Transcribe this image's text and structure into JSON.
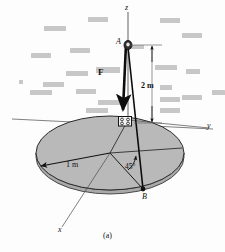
{
  "figure": {
    "caption": "(a)",
    "axes": {
      "z": "z",
      "y": "y",
      "x": "x"
    },
    "points": {
      "a": "A",
      "b": "B"
    },
    "force_label": "F",
    "dimensions": {
      "height": "2 m",
      "radius": "1 m"
    },
    "angle": "45°",
    "colors": {
      "disc_fill": "#b9b9b9",
      "disc_edge": "#2b2b2b",
      "line": "#1a1a1a",
      "axis": "#3c3c3c",
      "background_text": "#9b9b9b",
      "page": "#fdfdfd"
    }
  },
  "background_text_blocks": [
    {
      "x": 44,
      "y": 26,
      "w": 22,
      "h": 5
    },
    {
      "x": 88,
      "y": 17,
      "w": 20,
      "h": 5
    },
    {
      "x": 160,
      "y": 18,
      "w": 20,
      "h": 5
    },
    {
      "x": 182,
      "y": 33,
      "w": 20,
      "h": 5
    },
    {
      "x": 31,
      "y": 53,
      "w": 20,
      "h": 5
    },
    {
      "x": 70,
      "y": 48,
      "w": 20,
      "h": 5
    },
    {
      "x": 130,
      "y": 45,
      "w": 14,
      "h": 4
    },
    {
      "x": 66,
      "y": 71,
      "w": 22,
      "h": 5
    },
    {
      "x": 96,
      "y": 67,
      "w": 24,
      "h": 6
    },
    {
      "x": 155,
      "y": 65,
      "w": 22,
      "h": 5
    },
    {
      "x": 186,
      "y": 69,
      "w": 14,
      "h": 5
    },
    {
      "x": 19,
      "y": 80,
      "w": 4,
      "h": 4
    },
    {
      "x": 43,
      "y": 82,
      "w": 21,
      "h": 5
    },
    {
      "x": 30,
      "y": 90,
      "w": 22,
      "h": 5
    },
    {
      "x": 76,
      "y": 89,
      "w": 20,
      "h": 5
    },
    {
      "x": 160,
      "y": 85,
      "w": 12,
      "h": 5
    },
    {
      "x": 160,
      "y": 97,
      "w": 20,
      "h": 5
    },
    {
      "x": 98,
      "y": 100,
      "w": 22,
      "h": 5
    },
    {
      "x": 182,
      "y": 95,
      "w": 20,
      "h": 5
    },
    {
      "x": 86,
      "y": 108,
      "w": 22,
      "h": 5
    },
    {
      "x": 160,
      "y": 108,
      "w": 20,
      "h": 5
    },
    {
      "x": 212,
      "y": 90,
      "w": 13,
      "h": 5
    }
  ]
}
